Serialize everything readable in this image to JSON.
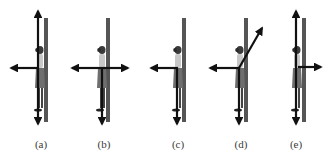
{
  "figure": {
    "panels": [
      {
        "label": "(a)",
        "label_x": 41,
        "wall_x": 44,
        "person_x": 36,
        "forces": [
          "up",
          "left",
          "down"
        ]
      },
      {
        "label": "(b)",
        "label_x": 104,
        "wall_x": 106,
        "person_x": 98,
        "forces": [
          "left",
          "right",
          "down"
        ]
      },
      {
        "label": "(c)",
        "label_x": 178,
        "wall_x": 182,
        "person_x": 174,
        "forces": [
          "left",
          "down"
        ]
      },
      {
        "label": "(d)",
        "label_x": 241,
        "wall_x": 244,
        "person_x": 236,
        "forces": [
          "diagonal-up-right",
          "left",
          "down"
        ]
      },
      {
        "label": "(e)",
        "label_x": 296,
        "wall_x": 302,
        "person_x": 294,
        "forces": [
          "up",
          "right",
          "down"
        ]
      }
    ],
    "colors": {
      "wall": "#555555",
      "arrow": "#111111",
      "person": "#8a8a8a",
      "label": "#3a3a3a"
    }
  }
}
